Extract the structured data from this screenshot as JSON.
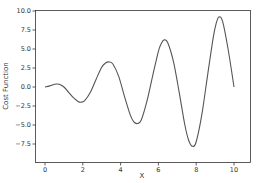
{
  "chart_data": {
    "type": "line",
    "title": "",
    "xlabel": "X",
    "ylabel": "Cost Function",
    "xlim": [
      -0.5,
      10.5
    ],
    "ylim": [
      -8.7,
      10.0
    ],
    "x_ticks": [
      0,
      2,
      4,
      6,
      8,
      10
    ],
    "x_tick_labels": [
      "0",
      "2",
      "4",
      "6",
      "8",
      "10"
    ],
    "y_ticks": [
      10.0,
      7.5,
      5.0,
      2.5,
      0.0,
      -2.5,
      -5.0,
      -7.5
    ],
    "y_tick_labels": [
      "10.0",
      "7.5",
      "5.0",
      "2.5",
      "0.0",
      "−2.5",
      "−5.0",
      "−7.5"
    ],
    "grid": false,
    "legend": null,
    "line_color": "#555555",
    "series": [
      {
        "name": "Cost Function",
        "x": [
          0,
          0.25,
          0.5,
          0.6,
          0.75,
          1.0,
          1.25,
          1.5,
          1.75,
          1.9,
          2.1,
          2.4,
          2.7,
          3.0,
          3.2,
          3.4,
          3.6,
          3.9,
          4.2,
          4.5,
          4.7,
          4.9,
          5.1,
          5.4,
          5.7,
          6.0,
          6.15,
          6.3,
          6.5,
          6.8,
          7.1,
          7.4,
          7.6,
          7.8,
          8.0,
          8.3,
          8.6,
          8.9,
          9.05,
          9.2,
          9.4,
          9.7,
          10.0
        ],
        "y": [
          0.0,
          0.15,
          0.35,
          0.4,
          0.35,
          0.0,
          -0.7,
          -1.4,
          -1.9,
          -2.0,
          -1.8,
          -0.7,
          1.0,
          2.6,
          3.15,
          3.3,
          3.0,
          1.4,
          -1.2,
          -3.6,
          -4.6,
          -4.8,
          -4.3,
          -1.8,
          1.5,
          4.7,
          5.7,
          6.2,
          5.8,
          3.3,
          -0.7,
          -5.0,
          -7.0,
          -7.8,
          -7.2,
          -3.6,
          1.5,
          6.5,
          8.3,
          9.2,
          8.6,
          4.8,
          0.0
        ]
      }
    ]
  }
}
